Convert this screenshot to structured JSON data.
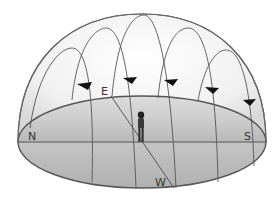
{
  "diagram": {
    "type": "celestial-sphere",
    "labels": {
      "north": "N",
      "south": "S",
      "east": "E",
      "west": "W"
    },
    "observer": "person-standing-at-center",
    "star_paths": 5,
    "arrows": 5,
    "colors": {
      "line": "#555555",
      "ground": "#c8c8c8",
      "ground_dark": "#b4b4b4",
      "dome_light": "#f7f7f7",
      "dome_edge": "#d6d6d6",
      "arrow": "#111111"
    }
  }
}
